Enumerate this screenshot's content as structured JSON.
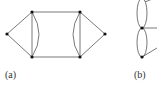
{
  "figure": {
    "panels": [
      {
        "label": "(a)",
        "vertices": [
          {
            "id": "L",
            "x": 7,
            "y": 34
          },
          {
            "id": "TL",
            "x": 32,
            "y": 12
          },
          {
            "id": "BL",
            "x": 32,
            "y": 57
          },
          {
            "id": "TR",
            "x": 80,
            "y": 12
          },
          {
            "id": "BR",
            "x": 80,
            "y": 57
          },
          {
            "id": "R",
            "x": 105,
            "y": 34
          }
        ],
        "edges": [
          [
            "L",
            "TL"
          ],
          [
            "L",
            "BL"
          ],
          [
            "TL",
            "BL",
            "straight"
          ],
          [
            "TL",
            "BL",
            "curved"
          ],
          [
            "TL",
            "TR"
          ],
          [
            "BL",
            "BR"
          ],
          [
            "TR",
            "BR",
            "straight"
          ],
          [
            "TR",
            "BR",
            "curved"
          ],
          [
            "TR",
            "R"
          ],
          [
            "BR",
            "R"
          ]
        ]
      },
      {
        "label": "(b)",
        "vertices": [
          {
            "id": "M",
            "x": 142,
            "y": 28
          },
          {
            "id": "B",
            "x": 142,
            "y": 57
          }
        ],
        "edges": "two ellipse double-edges (multi-edges) stacked vertically, plus edges leading right"
      }
    ]
  }
}
